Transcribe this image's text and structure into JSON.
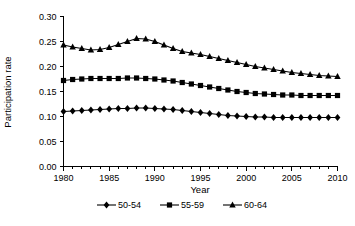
{
  "chart_data": {
    "type": "line",
    "title": "",
    "xlabel": "Year",
    "ylabel": "Participation rate",
    "xlim": [
      1980,
      2010
    ],
    "ylim": [
      0.0,
      0.3
    ],
    "grid": false,
    "legend_position": "bottom",
    "x_tick_labels": [
      "1980",
      "1985",
      "1990",
      "1995",
      "2000",
      "2005",
      "2010"
    ],
    "x_ticks": [
      1980,
      1985,
      1990,
      1995,
      2000,
      2005,
      2010
    ],
    "x_minor_step": 1,
    "y_tick_labels": [
      "0.00",
      "0.05",
      "0.10",
      "0.15",
      "0.20",
      "0.25",
      "0.30"
    ],
    "y_ticks": [
      0.0,
      0.05,
      0.1,
      0.15,
      0.2,
      0.25,
      0.3
    ],
    "x": [
      1980,
      1981,
      1982,
      1983,
      1984,
      1985,
      1986,
      1987,
      1988,
      1989,
      1990,
      1991,
      1992,
      1993,
      1994,
      1995,
      1996,
      1997,
      1998,
      1999,
      2000,
      2001,
      2002,
      2003,
      2004,
      2005,
      2006,
      2007,
      2008,
      2009,
      2010
    ],
    "series": [
      {
        "name": "50-54",
        "marker": "diamond",
        "values": [
          0.11,
          0.111,
          0.112,
          0.113,
          0.114,
          0.115,
          0.116,
          0.116,
          0.117,
          0.117,
          0.116,
          0.115,
          0.114,
          0.112,
          0.11,
          0.108,
          0.106,
          0.104,
          0.102,
          0.101,
          0.1,
          0.099,
          0.099,
          0.098,
          0.098,
          0.098,
          0.098,
          0.098,
          0.098,
          0.098,
          0.098
        ]
      },
      {
        "name": "55-59",
        "marker": "square",
        "values": [
          0.172,
          0.174,
          0.175,
          0.176,
          0.176,
          0.176,
          0.176,
          0.177,
          0.177,
          0.176,
          0.175,
          0.173,
          0.171,
          0.168,
          0.165,
          0.162,
          0.159,
          0.156,
          0.153,
          0.15,
          0.148,
          0.146,
          0.145,
          0.144,
          0.143,
          0.143,
          0.142,
          0.142,
          0.142,
          0.142,
          0.142
        ]
      },
      {
        "name": "60-64",
        "marker": "triangle",
        "values": [
          0.243,
          0.239,
          0.236,
          0.233,
          0.234,
          0.238,
          0.244,
          0.25,
          0.256,
          0.255,
          0.25,
          0.243,
          0.236,
          0.23,
          0.227,
          0.224,
          0.22,
          0.216,
          0.212,
          0.208,
          0.204,
          0.2,
          0.197,
          0.194,
          0.191,
          0.188,
          0.186,
          0.184,
          0.182,
          0.181,
          0.18
        ]
      }
    ]
  },
  "legend": {
    "items": [
      {
        "label": "50-54",
        "marker": "diamond"
      },
      {
        "label": "55-59",
        "marker": "square"
      },
      {
        "label": "60-64",
        "marker": "triangle"
      }
    ]
  }
}
